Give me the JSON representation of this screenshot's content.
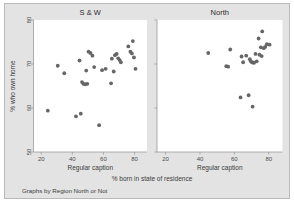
{
  "figure": {
    "background_color": "#e3e3e3",
    "panel_color": "#ffffff",
    "marker_color": "#666666",
    "axis_color": "#9a9a9a",
    "xlabel": "% born in state of residence",
    "ylabel": "% who own home",
    "note": "Graphs by Region North or Not"
  },
  "chart_data": {
    "type": "scatter",
    "title": "",
    "xlabel": "% born in state of residence",
    "ylabel": "% who own home",
    "note": "Graphs by Region North or Not",
    "xlim": [
      15,
      88
    ],
    "ylim": [
      50,
      80
    ],
    "xticks": [
      20,
      40,
      60,
      80
    ],
    "yticks": [
      50,
      60,
      70,
      80
    ],
    "grid": false,
    "legend": "none",
    "panels": [
      {
        "label": "S & W",
        "caption": "Regular caption",
        "xticklabels": [
          "20",
          "40",
          "60",
          "80"
        ],
        "yticklabels": [
          "50",
          "60",
          "70",
          "80"
        ],
        "points": [
          [
            24.2,
            59.4
          ],
          [
            30.6,
            69.6
          ],
          [
            34.8,
            67.9
          ],
          [
            42.3,
            58.1
          ],
          [
            45.4,
            58.7
          ],
          [
            44.6,
            70.8
          ],
          [
            46.2,
            65.9
          ],
          [
            47.1,
            65.5
          ],
          [
            48.3,
            65.4
          ],
          [
            49.6,
            65.5
          ],
          [
            48.9,
            68.5
          ],
          [
            50.4,
            72.8
          ],
          [
            51.6,
            72.5
          ],
          [
            52.9,
            71.9
          ],
          [
            54.0,
            69.3
          ],
          [
            57.2,
            56.1
          ],
          [
            59.1,
            68.6
          ],
          [
            61.4,
            68.9
          ],
          [
            64.9,
            65.6
          ],
          [
            65.4,
            71.2
          ],
          [
            66.6,
            68.3
          ],
          [
            67.4,
            72.0
          ],
          [
            68.5,
            72.3
          ],
          [
            69.5,
            71.3
          ],
          [
            70.4,
            70.9
          ],
          [
            71.2,
            70.4
          ],
          [
            76.0,
            74.0
          ],
          [
            77.3,
            72.8
          ],
          [
            78.3,
            72.4
          ],
          [
            78.9,
            75.2
          ],
          [
            79.6,
            71.5
          ],
          [
            80.6,
            68.9
          ]
        ]
      },
      {
        "label": "North",
        "caption": "Regular caption",
        "xticklabels": [
          "20",
          "40",
          "60",
          "80"
        ],
        "yticklabels": [
          "50",
          "60",
          "70",
          "80"
        ],
        "points": [
          [
            44.8,
            72.5
          ],
          [
            55.3,
            69.5
          ],
          [
            56.4,
            69.4
          ],
          [
            57.6,
            73.3
          ],
          [
            63.6,
            62.4
          ],
          [
            64.2,
            71.7
          ],
          [
            65.1,
            70.4
          ],
          [
            68.3,
            62.9
          ],
          [
            69.0,
            71.1
          ],
          [
            69.6,
            70.6
          ],
          [
            70.2,
            70.4
          ],
          [
            70.6,
            60.3
          ],
          [
            71.0,
            70.3
          ],
          [
            71.5,
            70.3
          ],
          [
            72.3,
            72.3
          ],
          [
            73.0,
            70.6
          ],
          [
            74.1,
            75.8
          ],
          [
            74.6,
            72.1
          ],
          [
            75.4,
            73.8
          ],
          [
            75.9,
            71.8
          ],
          [
            76.2,
            77.4
          ],
          [
            77.1,
            73.6
          ],
          [
            78.0,
            73.9
          ],
          [
            78.9,
            74.5
          ],
          [
            80.5,
            74.4
          ],
          [
            66.9,
            71.9
          ]
        ]
      }
    ]
  }
}
